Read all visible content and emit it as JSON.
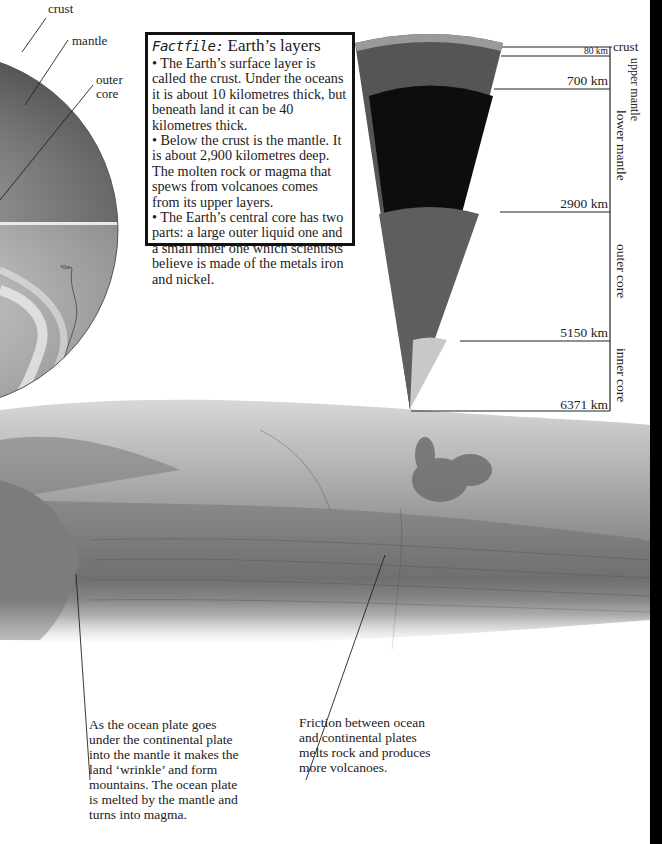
{
  "globe": {
    "labels": [
      {
        "id": "crust",
        "text": "crust"
      },
      {
        "id": "mantle",
        "text": "mantle"
      },
      {
        "id": "outer-core-1",
        "text": "outer"
      },
      {
        "id": "outer-core-2",
        "text": "core"
      }
    ]
  },
  "factfile": {
    "heading_script": "Factfile:",
    "heading": "Earth’s layers",
    "bullets": [
      "• The Earth’s surface layer is called the crust. Under the oceans it is about 10 kilometres thick, but beneath land it can be 40 kilometres thick.",
      "• Below the crust is the mantle. It is about 2,900 kilometres deep. The molten rock or magma that spews from volcanoes comes from its upper layers.",
      "• The Earth’s central core has two parts: a large outer liquid one and a small inner one which scientists believe is made of the metals iron and nickel."
    ]
  },
  "wedge": {
    "depths": [
      "80 km",
      "700 km",
      "2900 km",
      "5150 km",
      "6371 km"
    ],
    "layers": [
      "crust",
      "upper mantle",
      "lower mantle",
      "outer core",
      "inner core"
    ],
    "colors": {
      "crust": "#9a9a9a",
      "upper_mantle": "#555555",
      "lower_mantle": "#0d0d0d",
      "outer_core": "#5e5e5e",
      "inner_core": "#c8c8c8"
    }
  },
  "captions": {
    "left": "As the ocean plate goes under the continental plate into the mantle it makes the land ‘wrinkle’ and form mountains. The ocean plate is melted by the mantle and turns into magma.",
    "right": "Friction between ocean and continental plates melts rock and produces more volcanoes."
  }
}
